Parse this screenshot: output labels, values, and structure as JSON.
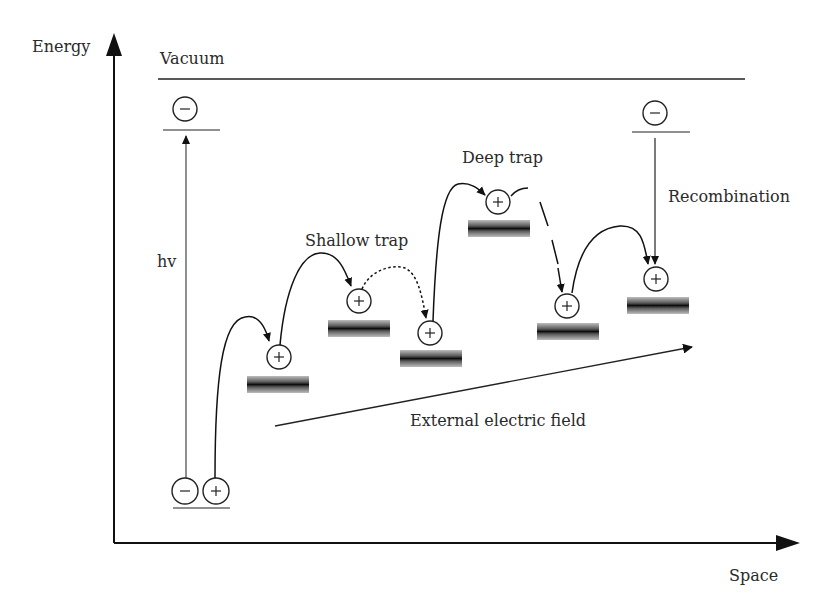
{
  "diagram": {
    "axes": {
      "y_label": "Energy",
      "x_label": "Space"
    },
    "levels": {
      "vacuum_label": "Vacuum"
    },
    "labels": {
      "photon": "hv",
      "shallow_trap": "Shallow trap",
      "deep_trap": "Deep trap",
      "recombination": "Recombination",
      "field": "External electric field"
    },
    "charges": {
      "electron_symbol": "−",
      "hole_symbol": "+"
    },
    "traps": [
      {
        "id": 1,
        "type": "trap",
        "bar_x": 247,
        "bar_y": 376,
        "hole_x": 279,
        "hole_y": 357
      },
      {
        "id": 2,
        "type": "shallow",
        "bar_x": 328,
        "bar_y": 320,
        "hole_x": 359,
        "hole_y": 301
      },
      {
        "id": 3,
        "type": "trap",
        "bar_x": 400,
        "bar_y": 350,
        "hole_x": 430,
        "hole_y": 333
      },
      {
        "id": 4,
        "type": "deep",
        "bar_x": 468,
        "bar_y": 220,
        "hole_x": 498,
        "hole_y": 202
      },
      {
        "id": 5,
        "type": "trap",
        "bar_x": 537,
        "bar_y": 323,
        "hole_x": 567,
        "hole_y": 306
      },
      {
        "id": 6,
        "type": "recombination site",
        "bar_x": 627,
        "bar_y": 297,
        "hole_x": 656,
        "hole_y": 279
      }
    ],
    "colors": {
      "line": "#1a1a1a",
      "trap_bar_core": "#111111",
      "trap_bar_edge": "#9a9a9a",
      "text": "#2a2a2a"
    }
  }
}
